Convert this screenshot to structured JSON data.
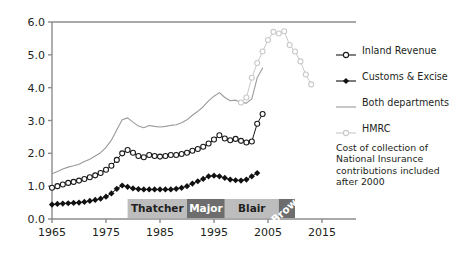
{
  "chart_data": {
    "type": "line",
    "title": "",
    "xlabel": "",
    "ylabel": "£ billion (2012–13 values)",
    "xlim": [
      1965,
      2015
    ],
    "ylim": [
      0.0,
      6.0
    ],
    "xticks": [
      1965,
      1975,
      1985,
      1995,
      2005,
      2015
    ],
    "yticks": [
      "0.0",
      "1.0",
      "2.0",
      "3.0",
      "4.0",
      "5.0",
      "6.0"
    ],
    "grid": false,
    "legend_position": "right",
    "series": [
      {
        "name": "Inland Revenue",
        "marker": "open-circle",
        "color": "#1a1a1a",
        "x": [
          1965,
          1966,
          1967,
          1968,
          1969,
          1970,
          1971,
          1972,
          1973,
          1974,
          1975,
          1976,
          1977,
          1978,
          1979,
          1980,
          1981,
          1982,
          1983,
          1984,
          1985,
          1986,
          1987,
          1988,
          1989,
          1990,
          1991,
          1992,
          1993,
          1994,
          1995,
          1996,
          1997,
          1998,
          1999,
          2000,
          2001,
          2002,
          2003,
          2004
        ],
        "y": [
          0.95,
          1.0,
          1.05,
          1.1,
          1.13,
          1.17,
          1.22,
          1.27,
          1.33,
          1.4,
          1.5,
          1.62,
          1.8,
          2.0,
          2.1,
          2.02,
          1.92,
          1.88,
          1.95,
          1.92,
          1.9,
          1.92,
          1.95,
          1.95,
          1.98,
          2.02,
          2.08,
          2.13,
          2.2,
          2.3,
          2.42,
          2.55,
          2.45,
          2.4,
          2.44,
          2.38,
          2.33,
          2.36,
          2.9,
          3.2
        ]
      },
      {
        "name": "Customs & Excise",
        "marker": "filled-diamond",
        "color": "#111111",
        "x": [
          1965,
          1966,
          1967,
          1968,
          1969,
          1970,
          1971,
          1972,
          1973,
          1974,
          1975,
          1976,
          1977,
          1978,
          1979,
          1980,
          1981,
          1982,
          1983,
          1984,
          1985,
          1986,
          1987,
          1988,
          1989,
          1990,
          1991,
          1992,
          1993,
          1994,
          1995,
          1996,
          1997,
          1998,
          1999,
          2000,
          2001,
          2002,
          2003
        ],
        "y": [
          0.44,
          0.46,
          0.47,
          0.48,
          0.49,
          0.5,
          0.52,
          0.55,
          0.58,
          0.62,
          0.68,
          0.78,
          0.92,
          1.02,
          0.98,
          0.93,
          0.91,
          0.9,
          0.9,
          0.9,
          0.9,
          0.9,
          0.9,
          0.92,
          0.95,
          1.0,
          1.08,
          1.15,
          1.22,
          1.3,
          1.32,
          1.3,
          1.25,
          1.2,
          1.18,
          1.17,
          1.2,
          1.3,
          1.4
        ]
      },
      {
        "name": "Both departments",
        "marker": "none",
        "color": "#9a9a9a",
        "x": [
          1965,
          1966,
          1967,
          1968,
          1969,
          1970,
          1971,
          1972,
          1973,
          1974,
          1975,
          1976,
          1977,
          1978,
          1979,
          1980,
          1981,
          1982,
          1983,
          1984,
          1985,
          1986,
          1987,
          1988,
          1989,
          1990,
          1991,
          1992,
          1993,
          1994,
          1995,
          1996,
          1997,
          1998,
          1999,
          2000,
          2001,
          2002,
          2003,
          2004
        ],
        "y": [
          1.38,
          1.45,
          1.52,
          1.58,
          1.62,
          1.67,
          1.75,
          1.82,
          1.92,
          2.02,
          2.18,
          2.4,
          2.72,
          3.02,
          3.08,
          2.95,
          2.83,
          2.78,
          2.85,
          2.82,
          2.8,
          2.82,
          2.85,
          2.87,
          2.93,
          3.02,
          3.16,
          3.28,
          3.42,
          3.6,
          3.74,
          3.85,
          3.7,
          3.6,
          3.62,
          3.55,
          3.53,
          3.66,
          4.3,
          4.6
        ]
      },
      {
        "name": "HMRC",
        "marker": "open-circle-light",
        "color": "#c9c9c9",
        "x": [
          2000,
          2001,
          2002,
          2003,
          2004,
          2005,
          2006,
          2007,
          2008,
          2009,
          2010,
          2011,
          2012,
          2013
        ],
        "y": [
          3.55,
          3.7,
          4.3,
          4.75,
          5.1,
          5.45,
          5.7,
          5.65,
          5.72,
          5.3,
          5.1,
          4.8,
          4.4,
          4.1
        ]
      }
    ],
    "annotations": [
      {
        "label": "Thatcher",
        "start": 1979,
        "end": 1990,
        "style": "light-bar"
      },
      {
        "label": "Major",
        "start": 1990,
        "end": 1997,
        "style": "dark-bar"
      },
      {
        "label": "Blair",
        "start": 1997,
        "end": 2007,
        "style": "light-bar"
      },
      {
        "label": "Brown",
        "start": 2007,
        "end": 2010,
        "style": "dark-bar-rotated"
      }
    ],
    "note": "Cost of collection of National Insurance contributions included after 2000"
  },
  "legend": {
    "items": [
      {
        "label": "Inland Revenue",
        "marker": "open-circle"
      },
      {
        "label": "Customs & Excise",
        "marker": "filled-diamond"
      },
      {
        "label": "Both departments",
        "marker": "plain-line"
      },
      {
        "label": "HMRC",
        "marker": "open-circle-light"
      }
    ]
  },
  "colors": {
    "axis": "#8c8c8c",
    "ink": "#231f20",
    "both_departments": "#9a9a9a",
    "hmrc": "#c9c9c9",
    "bar_light": "#bdbdbd",
    "bar_dark": "#6d6d6d"
  }
}
